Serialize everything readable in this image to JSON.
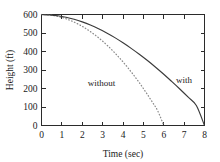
{
  "chart_data": {
    "type": "line",
    "title": "",
    "xlabel": "Time (sec)",
    "ylabel": "Height (ft)",
    "xlim": [
      0,
      8
    ],
    "ylim": [
      0,
      600
    ],
    "grid": false,
    "legend_position": "inline-annotations",
    "xticks": [
      0,
      1,
      2,
      3,
      4,
      5,
      6,
      7,
      8
    ],
    "yticks": [
      0,
      100,
      200,
      300,
      400,
      500,
      600
    ],
    "xtick_labels": [
      "0",
      "1",
      "2",
      "3",
      "4",
      "5",
      "6",
      "7",
      "8"
    ],
    "ytick_labels": [
      "0",
      "100",
      "200",
      "300",
      "400",
      "500",
      "600"
    ],
    "annotations": [
      {
        "text": "without",
        "x": 2.95,
        "y": 215
      },
      {
        "text": "with",
        "x": 7.0,
        "y": 230
      }
    ],
    "series": [
      {
        "name": "with",
        "style": "solid",
        "color": "#3a3a3a",
        "x": [
          0,
          0.4,
          0.8,
          1.2,
          1.6,
          2.0,
          2.4,
          2.8,
          3.2,
          3.6,
          4.0,
          4.4,
          4.8,
          5.2,
          5.6,
          6.0,
          6.4,
          6.8,
          7.2,
          7.6,
          8.0
        ],
        "y": [
          600,
          598,
          593,
          585,
          574,
          560,
          543,
          523,
          500,
          475,
          447,
          417,
          385,
          351,
          315,
          277,
          237,
          196,
          153,
          108,
          0
        ]
      },
      {
        "name": "without",
        "style": "dotted",
        "color": "#8a8a8a",
        "x": [
          0,
          0.3,
          0.6,
          0.9,
          1.2,
          1.5,
          1.8,
          2.1,
          2.4,
          2.7,
          3.0,
          3.3,
          3.6,
          3.9,
          4.2,
          4.5,
          4.8,
          5.1,
          5.4,
          5.7,
          6.0
        ],
        "y": [
          600,
          598.6,
          594.2,
          587.0,
          576.9,
          563.9,
          548.1,
          529.3,
          507.7,
          483.2,
          455.8,
          425.6,
          392.4,
          356.4,
          317.6,
          275.8,
          231.2,
          183.7,
          133.3,
          80.1,
          0
        ]
      }
    ]
  },
  "axis_titles": {
    "x": "Time (sec)",
    "y": "Height (ft)"
  },
  "labels": {
    "without": "without",
    "with": "with"
  },
  "colors": {
    "solid_curve": "#3a3a3a",
    "dotted_curve": "#8a8a8a",
    "axis": "#2b2b2b",
    "background": "#ffffff"
  }
}
